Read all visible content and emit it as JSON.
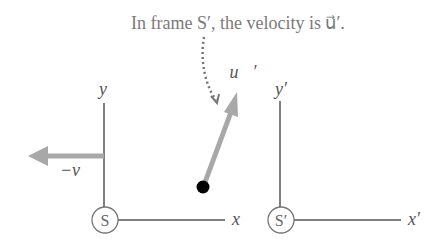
{
  "caption": {
    "text": "In frame S′, the velocity is u⃗′."
  },
  "frame_s": {
    "name": "S",
    "y_axis_label": "y",
    "x_axis_label": "x",
    "velocity_label": "−v"
  },
  "frame_s_prime": {
    "name": "S′",
    "y_axis_label": "y′",
    "x_axis_label": "x′"
  },
  "object": {
    "velocity_label": "u⃗′"
  },
  "colors": {
    "axis": "#555555",
    "arrow": "#a8a8a8",
    "dot": "#000000",
    "text": "#7a7a7a"
  }
}
